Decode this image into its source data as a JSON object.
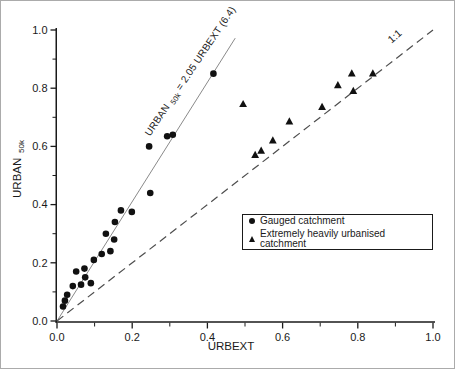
{
  "chart_data": {
    "type": "scatter",
    "title": "",
    "xlabel": "URBEXT",
    "ylabel": {
      "main": "URBAN",
      "sub": "50k"
    },
    "xlim": [
      0.0,
      1.0
    ],
    "ylim": [
      0.0,
      1.0
    ],
    "x_ticks": [
      0.0,
      0.2,
      0.4,
      0.6,
      0.8,
      1.0
    ],
    "y_ticks": [
      0.0,
      0.2,
      0.4,
      0.6,
      0.8,
      1.0
    ],
    "minor_tick_step": 0.1,
    "grid": false,
    "legend_position": "lower right",
    "series": [
      {
        "name": "Gauged catchment",
        "marker": "circle",
        "points": [
          [
            0.016,
            0.05
          ],
          [
            0.021,
            0.07
          ],
          [
            0.027,
            0.09
          ],
          [
            0.042,
            0.12
          ],
          [
            0.064,
            0.125
          ],
          [
            0.09,
            0.13
          ],
          [
            0.075,
            0.15
          ],
          [
            0.051,
            0.17
          ],
          [
            0.073,
            0.18
          ],
          [
            0.098,
            0.21
          ],
          [
            0.119,
            0.23
          ],
          [
            0.142,
            0.24
          ],
          [
            0.152,
            0.28
          ],
          [
            0.13,
            0.3
          ],
          [
            0.154,
            0.34
          ],
          [
            0.17,
            0.38
          ],
          [
            0.199,
            0.375
          ],
          [
            0.248,
            0.44
          ],
          [
            0.245,
            0.6
          ],
          [
            0.293,
            0.635
          ],
          [
            0.308,
            0.64
          ],
          [
            0.416,
            0.85
          ]
        ]
      },
      {
        "name": "Extremely heavily urbanised catchment",
        "marker": "triangle",
        "points": [
          [
            0.495,
            0.745
          ],
          [
            0.527,
            0.57
          ],
          [
            0.543,
            0.585
          ],
          [
            0.574,
            0.62
          ],
          [
            0.618,
            0.685
          ],
          [
            0.705,
            0.735
          ],
          [
            0.747,
            0.81
          ],
          [
            0.784,
            0.85
          ],
          [
            0.788,
            0.79
          ],
          [
            0.84,
            0.85
          ]
        ]
      }
    ],
    "lines": [
      {
        "name": "regression",
        "style": "solid",
        "slope": 2.05,
        "from": [
          0.0,
          0.0
        ],
        "to": [
          0.474,
          0.972
        ],
        "equation": {
          "prefix": "URBAN",
          "subscript": "50k",
          "suffix": " = 2.05 URBEXT  (6.4)"
        }
      },
      {
        "name": "identity",
        "style": "dashed",
        "slope": 1.0,
        "from": [
          0.0,
          0.0
        ],
        "to": [
          1.0,
          1.0
        ],
        "label": "1:1"
      }
    ]
  },
  "colors": {
    "background": "#ffffff",
    "marker": "#111111",
    "axis": "#1a1a1a",
    "regression_line": "#8a8a8a",
    "identity_line": "#4d4d4d"
  }
}
